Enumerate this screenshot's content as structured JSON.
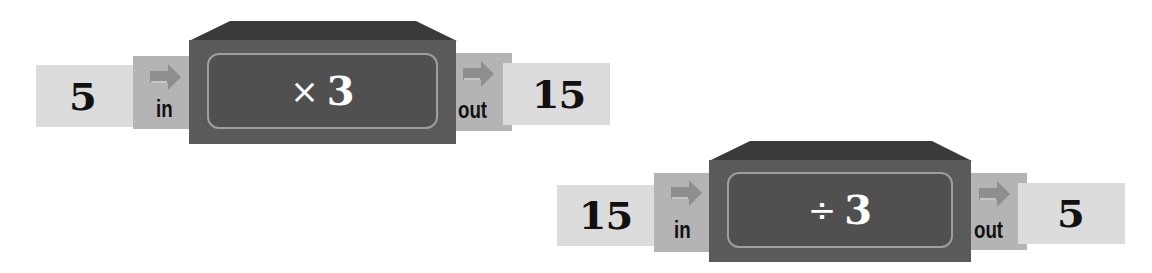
{
  "machines": [
    {
      "input": "5",
      "in_label": "in",
      "operator_symbol": "×",
      "operand": "3",
      "out_label": "out",
      "output": "15"
    },
    {
      "input": "15",
      "in_label": "in",
      "operator_symbol": "÷",
      "operand": "3",
      "out_label": "out",
      "output": "5"
    }
  ],
  "colors": {
    "card": "#dcdcdc",
    "port": "#b4b4b4",
    "arrow": "#8e8e8e",
    "box_body": "#5a5a5a",
    "box_lid": "#3a3a3a",
    "panel_border": "#9e9e9e",
    "operator_text": "#ffffff",
    "number_text": "#111111"
  }
}
